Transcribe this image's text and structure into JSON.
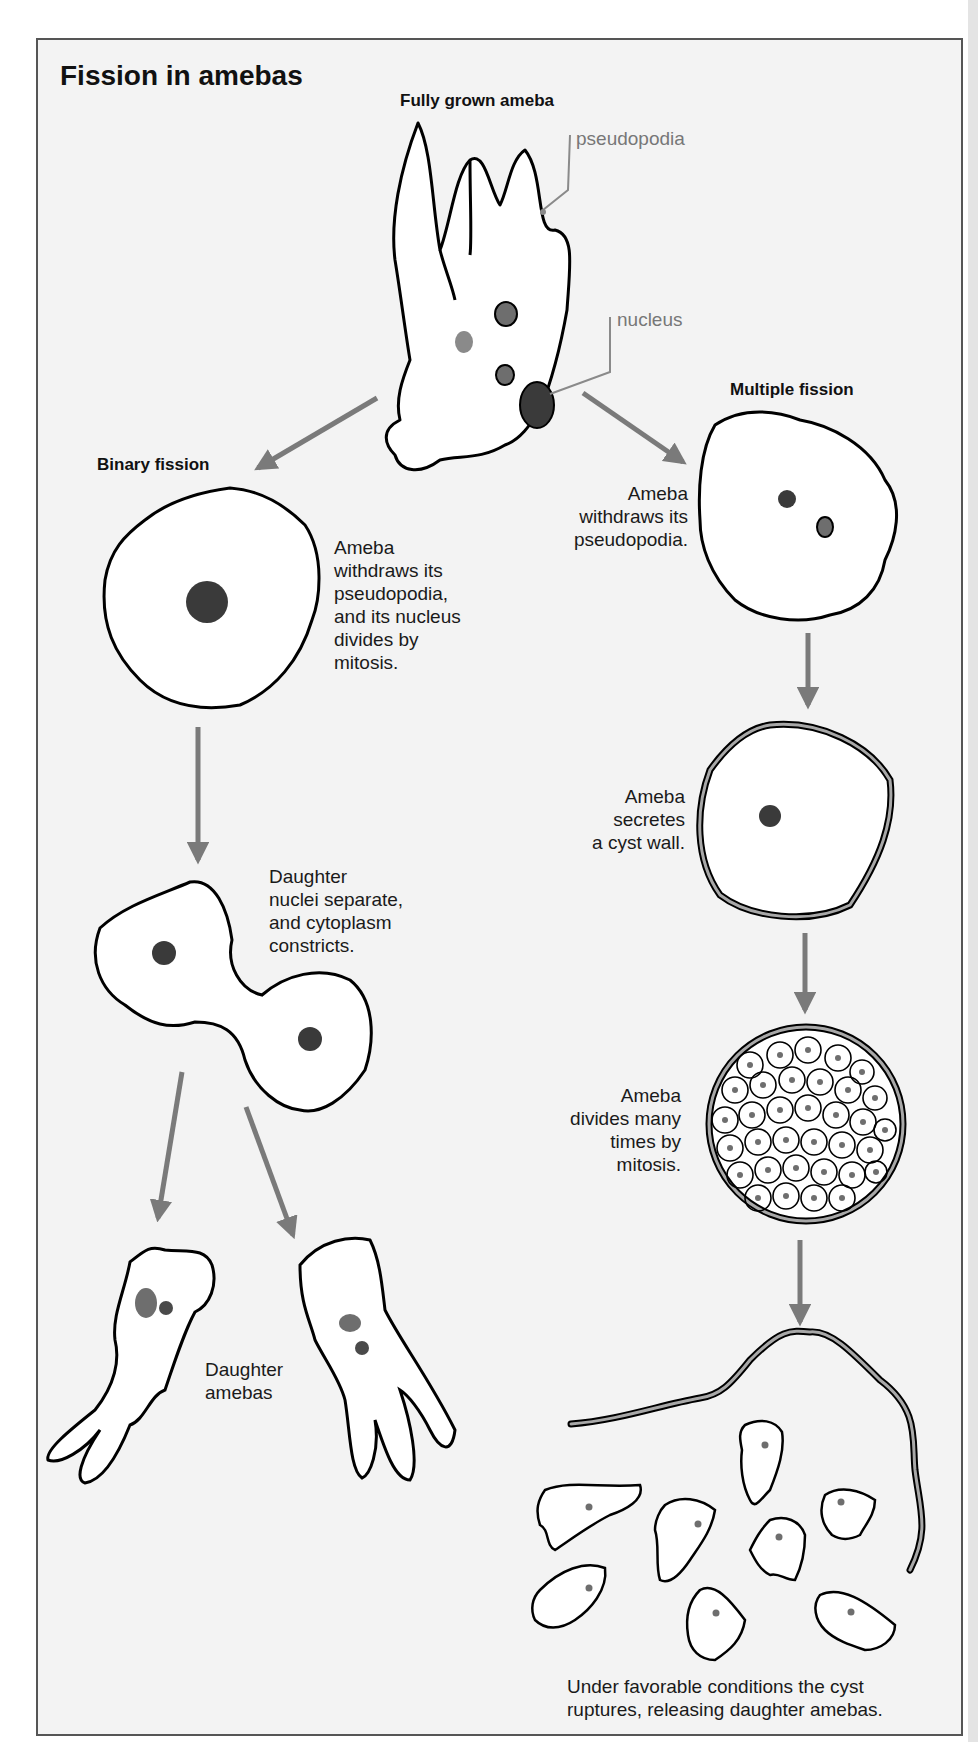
{
  "figure": {
    "title": "Fission in amebas",
    "top": {
      "heading": "Fully grown ameba",
      "labels": {
        "pseudopodia": "pseudopodia",
        "nucleus": "nucleus"
      }
    },
    "binary_fission": {
      "heading": "Binary fission",
      "steps": [
        "Ameba withdraws its pseudopodia, and its nucleus divides by mitosis.",
        "Daughter nuclei separate, and cytoplasm constricts.",
        "Daughter amebas"
      ],
      "step1_lines": [
        "Ameba",
        "withdraws its",
        "pseudopodia,",
        "and its nucleus",
        "divides by",
        "mitosis."
      ],
      "step2_lines": [
        "Daughter",
        "nuclei separate,",
        "and cytoplasm",
        "constricts."
      ],
      "step3_lines": [
        "Daughter",
        "amebas"
      ]
    },
    "multiple_fission": {
      "heading": "Multiple fission",
      "step1_lines": [
        "Ameba",
        "withdraws its",
        "pseudopodia."
      ],
      "step2_lines": [
        "Ameba",
        "secretes",
        "a cyst wall."
      ],
      "step3_lines": [
        "Ameba",
        "divides many",
        "times by",
        "mitosis."
      ],
      "step4_lines": [
        "Under favorable conditions the cyst",
        "ruptures, releasing daughter amebas."
      ]
    },
    "colors": {
      "background": "#f3f3f3",
      "outline": "#000000",
      "arrow": "#7a7a7a",
      "nucleus_dark": "#3a3a3a",
      "nucleus_mid": "#6e6e6e",
      "leader_line": "#8a8a8a",
      "cyst_wall": "#a8a8a8"
    }
  }
}
